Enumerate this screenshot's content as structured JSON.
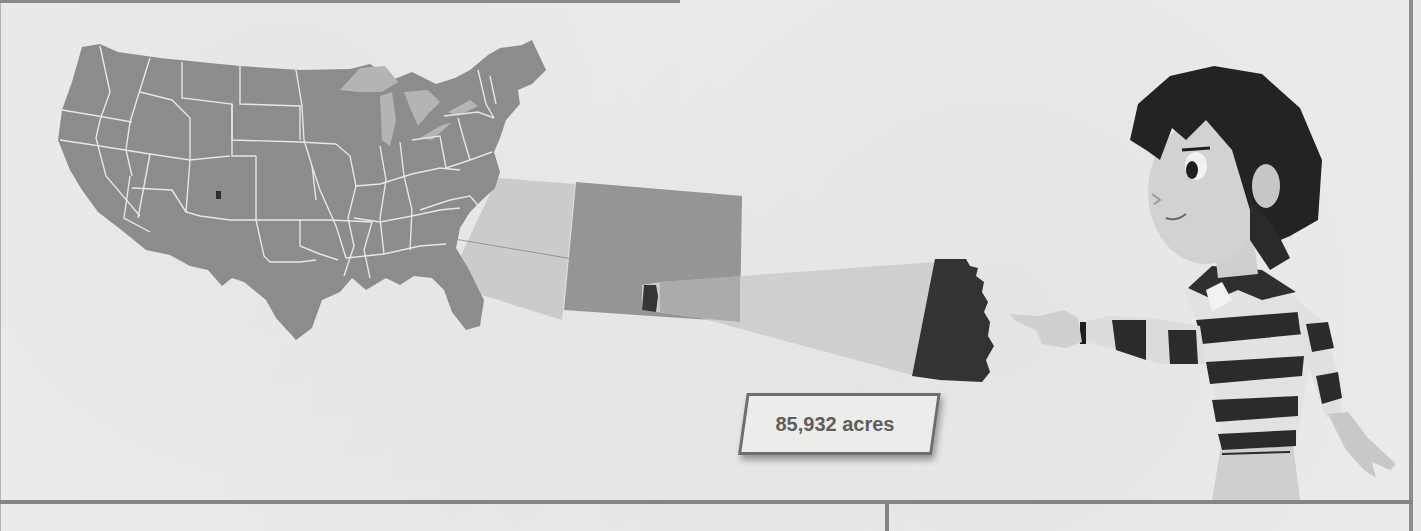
{
  "figure": {
    "type": "zoom-map-illustration",
    "levels": [
      {
        "name": "us-map",
        "description": "Contiguous United States map with state borders"
      },
      {
        "name": "state-zoom",
        "description": "Enlarged state rectangle (Colorado-shaped)"
      },
      {
        "name": "county-zoom",
        "description": "Enlarged dark county shape"
      }
    ],
    "callout": {
      "label": "85,932 acres"
    },
    "character": {
      "description": "Cartoon boy in striped shirt pointing left toward the zoomed county"
    }
  },
  "colors": {
    "page_bg": "#ebebe9",
    "map_fill": "#8c8c8c",
    "state_borders": "#e6e6e6",
    "lakes": "#b4b4b4",
    "zoom_beam": "#c8c8c8",
    "state_zoom": "#959595",
    "county_dark": "#333333",
    "rule": "#858585",
    "callout_text": "#5e5e5e"
  }
}
